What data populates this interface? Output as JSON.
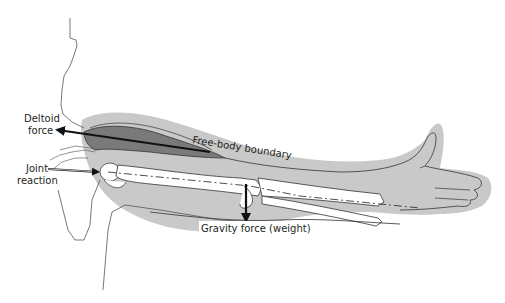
{
  "diagram": {
    "labels": {
      "deltoid_line1": "Deltoid",
      "deltoid_line2": "force",
      "joint_line1": "Joint",
      "joint_line2": "reaction",
      "boundary": "Free-body boundary",
      "gravity": "Gravity force (weight)"
    },
    "colors": {
      "boundary_fill": "#c9c9c9",
      "muscle_dark": "#6e6e6e",
      "muscle_mid": "#9a9a9a",
      "bone": "#ffffff",
      "outline": "#3a3a3a",
      "arrow": "#111111"
    }
  }
}
